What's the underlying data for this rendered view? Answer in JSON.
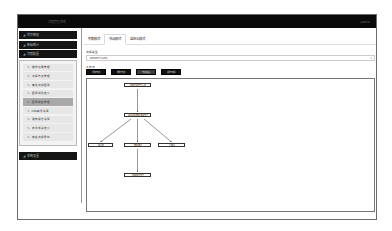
{
  "topbar": {
    "title": "流程管理系统",
    "user": "admin"
  },
  "sidebar": {
    "sections": [
      {
        "label": "首页概览",
        "icon": "chart-icon"
      },
      {
        "label": "数据统计",
        "icon": "chart-icon"
      },
      {
        "label": "流程配置",
        "icon": "chart-icon"
      }
    ],
    "submenu": [
      {
        "label": "操作记录管理",
        "active": false
      },
      {
        "label": "流程节点管理",
        "active": false
      },
      {
        "label": "审批流程配置",
        "active": false
      },
      {
        "label": "配置规则定义",
        "active": false
      },
      {
        "label": "配置模板管理",
        "active": true
      },
      {
        "label": "CMS条件设置",
        "active": false
      },
      {
        "label": "通知消息设置",
        "active": false
      },
      {
        "label": "表单字段定义",
        "active": false
      },
      {
        "label": "模板流程导出",
        "active": false
      }
    ],
    "footer_section": {
      "label": "系统设置",
      "icon": "chart-icon"
    }
  },
  "tabs": [
    {
      "label": "列表模式",
      "active": false
    },
    {
      "label": "节点模式",
      "active": true
    },
    {
      "label": "自定义模式",
      "active": false
    }
  ],
  "form": {
    "select_label": "流程类型",
    "select_value": "DOOOTYLVPS",
    "flow_label": "工作流"
  },
  "buttons": [
    {
      "label": "添加节点",
      "style": "dark"
    },
    {
      "label": "删除节点",
      "style": "dark"
    },
    {
      "label": "节点连接",
      "style": "alt"
    },
    {
      "label": "保存流程",
      "style": "dark"
    }
  ],
  "flowchart": {
    "nodes": [
      {
        "id": "start",
        "label": "流程开始节点入口",
        "x": 37,
        "y": 4,
        "w": 27
      },
      {
        "id": "decide",
        "label": "条件判断审批流程节点",
        "x": 37,
        "y": 34,
        "w": 27
      },
      {
        "id": "a",
        "label": "驳回处",
        "x": 1,
        "y": 64,
        "w": 25
      },
      {
        "id": "b",
        "label": "审批通过",
        "x": 37,
        "y": 64,
        "w": 27
      },
      {
        "id": "c",
        "label": "已撤回",
        "x": 71,
        "y": 64,
        "w": 27
      },
      {
        "id": "end",
        "label": "流程结束节点",
        "x": 37,
        "y": 94,
        "w": 27
      }
    ]
  }
}
